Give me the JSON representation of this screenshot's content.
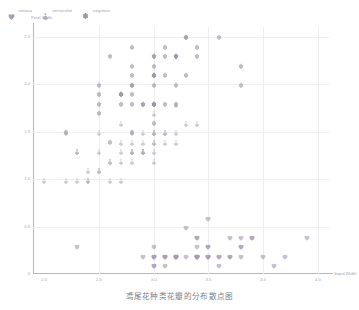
{
  "chart_data": {
    "type": "scatter",
    "title": "鸢尾花种类花瓣的分布散点图",
    "xlabel": "Sepal.Width",
    "ylabel": "Petal.Width",
    "xlim": [
      1.9,
      4.6
    ],
    "ylim": [
      0,
      2.6
    ],
    "x_ticks": [
      "2.0",
      "2.5",
      "3.0",
      "3.5",
      "4.0",
      "4.5"
    ],
    "x_tick_values": [
      2.0,
      2.5,
      3.0,
      3.5,
      4.0,
      4.5
    ],
    "y_ticks": [
      "0",
      "0.5",
      "1.0",
      "1.5",
      "2.0",
      "2.5"
    ],
    "y_tick_values": [
      0,
      0.5,
      1.0,
      1.5,
      2.0,
      2.5
    ],
    "grid": true,
    "legend_position": "top-left",
    "series": [
      {
        "name": "setosa",
        "symbol": "heart",
        "color": "#a89ab0",
        "points": [
          [
            3.5,
            0.2
          ],
          [
            3.0,
            0.2
          ],
          [
            3.2,
            0.2
          ],
          [
            3.1,
            0.2
          ],
          [
            3.6,
            0.2
          ],
          [
            3.9,
            0.4
          ],
          [
            3.4,
            0.3
          ],
          [
            3.4,
            0.2
          ],
          [
            2.9,
            0.2
          ],
          [
            3.1,
            0.1
          ],
          [
            3.7,
            0.2
          ],
          [
            3.4,
            0.2
          ],
          [
            3.0,
            0.1
          ],
          [
            3.0,
            0.1
          ],
          [
            4.0,
            0.2
          ],
          [
            4.4,
            0.4
          ],
          [
            3.9,
            0.4
          ],
          [
            3.5,
            0.3
          ],
          [
            3.8,
            0.3
          ],
          [
            3.8,
            0.3
          ],
          [
            3.4,
            0.2
          ],
          [
            3.7,
            0.4
          ],
          [
            3.6,
            0.2
          ],
          [
            3.3,
            0.5
          ],
          [
            3.4,
            0.2
          ],
          [
            3.0,
            0.2
          ],
          [
            3.4,
            0.4
          ],
          [
            3.5,
            0.2
          ],
          [
            3.4,
            0.2
          ],
          [
            3.2,
            0.2
          ],
          [
            3.1,
            0.2
          ],
          [
            3.4,
            0.4
          ],
          [
            4.1,
            0.1
          ],
          [
            4.2,
            0.2
          ],
          [
            3.1,
            0.2
          ],
          [
            3.2,
            0.2
          ],
          [
            3.5,
            0.2
          ],
          [
            3.6,
            0.1
          ],
          [
            3.0,
            0.2
          ],
          [
            3.4,
            0.2
          ],
          [
            3.5,
            0.3
          ],
          [
            2.3,
            0.3
          ],
          [
            3.2,
            0.2
          ],
          [
            3.5,
            0.6
          ],
          [
            3.8,
            0.4
          ],
          [
            3.0,
            0.3
          ],
          [
            3.8,
            0.2
          ],
          [
            3.2,
            0.2
          ],
          [
            3.7,
            0.2
          ],
          [
            3.3,
            0.2
          ]
        ]
      },
      {
        "name": "versicolor",
        "symbol": "triangle",
        "color": "#b3b0ba",
        "points": [
          [
            3.2,
            1.4
          ],
          [
            3.2,
            1.5
          ],
          [
            3.1,
            1.5
          ],
          [
            2.3,
            1.3
          ],
          [
            2.8,
            1.5
          ],
          [
            2.8,
            1.3
          ],
          [
            3.3,
            1.6
          ],
          [
            2.4,
            1.0
          ],
          [
            2.9,
            1.3
          ],
          [
            2.7,
            1.4
          ],
          [
            2.0,
            1.0
          ],
          [
            3.0,
            1.5
          ],
          [
            2.2,
            1.0
          ],
          [
            2.9,
            1.4
          ],
          [
            2.9,
            1.3
          ],
          [
            3.1,
            1.4
          ],
          [
            3.0,
            1.5
          ],
          [
            2.7,
            1.0
          ],
          [
            2.2,
            1.5
          ],
          [
            2.5,
            1.1
          ],
          [
            3.2,
            1.8
          ],
          [
            2.8,
            1.3
          ],
          [
            2.5,
            1.5
          ],
          [
            2.8,
            1.2
          ],
          [
            2.9,
            1.3
          ],
          [
            3.0,
            1.4
          ],
          [
            2.8,
            1.4
          ],
          [
            3.0,
            1.7
          ],
          [
            2.9,
            1.5
          ],
          [
            2.6,
            1.0
          ],
          [
            2.4,
            1.1
          ],
          [
            2.4,
            1.0
          ],
          [
            2.7,
            1.2
          ],
          [
            2.7,
            1.6
          ],
          [
            3.0,
            1.5
          ],
          [
            3.4,
            1.6
          ],
          [
            3.1,
            1.5
          ],
          [
            2.3,
            1.3
          ],
          [
            3.0,
            1.3
          ],
          [
            2.5,
            1.3
          ],
          [
            2.6,
            1.2
          ],
          [
            3.0,
            1.4
          ],
          [
            2.6,
            1.2
          ],
          [
            2.3,
            1.0
          ],
          [
            2.7,
            1.3
          ],
          [
            3.0,
            1.2
          ],
          [
            2.9,
            1.3
          ],
          [
            2.9,
            1.3
          ],
          [
            2.5,
            1.1
          ],
          [
            2.8,
            1.3
          ]
        ]
      },
      {
        "name": "virginica",
        "symbol": "flower",
        "color": "#9b93a6",
        "points": [
          [
            3.3,
            2.5
          ],
          [
            2.7,
            1.9
          ],
          [
            3.0,
            2.1
          ],
          [
            2.9,
            1.8
          ],
          [
            3.0,
            2.2
          ],
          [
            3.0,
            2.1
          ],
          [
            2.5,
            1.7
          ],
          [
            2.9,
            1.8
          ],
          [
            2.5,
            1.8
          ],
          [
            3.6,
            2.5
          ],
          [
            3.2,
            2.0
          ],
          [
            2.7,
            1.9
          ],
          [
            3.0,
            2.1
          ],
          [
            2.5,
            2.0
          ],
          [
            2.8,
            2.4
          ],
          [
            3.2,
            2.3
          ],
          [
            3.0,
            1.8
          ],
          [
            3.8,
            2.2
          ],
          [
            2.6,
            2.3
          ],
          [
            2.2,
            1.5
          ],
          [
            3.2,
            2.3
          ],
          [
            2.8,
            2.0
          ],
          [
            2.8,
            2.0
          ],
          [
            2.7,
            1.8
          ],
          [
            3.3,
            2.1
          ],
          [
            3.2,
            1.8
          ],
          [
            2.8,
            1.8
          ],
          [
            3.0,
            1.8
          ],
          [
            2.8,
            2.1
          ],
          [
            3.0,
            1.6
          ],
          [
            2.8,
            1.9
          ],
          [
            3.8,
            2.0
          ],
          [
            2.8,
            2.2
          ],
          [
            2.8,
            1.5
          ],
          [
            2.6,
            1.4
          ],
          [
            3.0,
            2.3
          ],
          [
            3.4,
            2.4
          ],
          [
            3.1,
            1.8
          ],
          [
            3.0,
            1.8
          ],
          [
            3.1,
            2.1
          ],
          [
            3.1,
            2.4
          ],
          [
            3.1,
            2.3
          ],
          [
            2.7,
            1.9
          ],
          [
            3.2,
            2.3
          ],
          [
            3.3,
            2.5
          ],
          [
            3.0,
            2.3
          ],
          [
            2.5,
            1.9
          ],
          [
            3.0,
            2.0
          ],
          [
            3.4,
            2.3
          ],
          [
            3.0,
            1.8
          ]
        ]
      }
    ]
  },
  "legend": {
    "items": [
      {
        "label": "setosa",
        "symbol": "heart",
        "color": "#a89ab0"
      },
      {
        "label": "versicolor",
        "symbol": "triangle",
        "color": "#b3b0ba"
      },
      {
        "label": "virginica",
        "symbol": "flower",
        "color": "#9b93a6"
      }
    ]
  }
}
